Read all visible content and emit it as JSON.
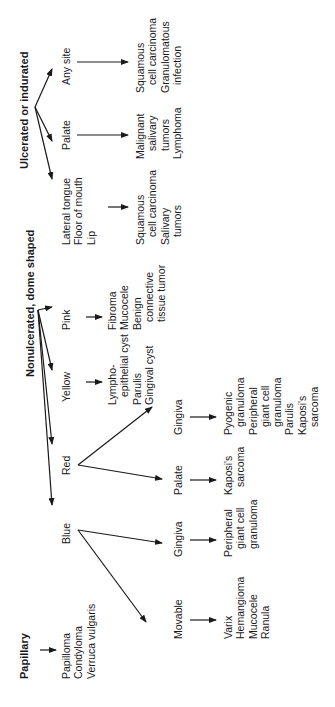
{
  "diagram": {
    "papillary": {
      "title": "Papillary",
      "items": [
        "Papilloma",
        "Condyloma",
        "Verruca vulgaris"
      ]
    },
    "nonulcerated": {
      "title": "Nonulcerated, dome shaped",
      "blue": {
        "label": "Blue",
        "movable": {
          "label": "Movable",
          "items": [
            "Varix",
            "Hemangioma",
            "Mucocele",
            "Ranula"
          ]
        },
        "gingiva": {
          "label": "Gingiva",
          "items": [
            "Peripheral",
            "giant cell",
            "granuloma"
          ]
        }
      },
      "red": {
        "label": "Red",
        "palate": {
          "label": "Palate",
          "items": [
            "Kaposi's",
            "sarcoma"
          ]
        },
        "gingiva": {
          "label": "Gingiva",
          "items": [
            "Pyogenic",
            "granuloma",
            "Peripheral",
            "giant cell",
            "granuloma",
            "Parulis",
            "Kaposi's",
            "sarcoma"
          ]
        }
      },
      "yellow": {
        "label": "Yellow",
        "items": [
          "Lympho-",
          "epithelial cyst",
          "Parulis",
          "Gingival cyst"
        ]
      },
      "pink": {
        "label": "Pink",
        "items": [
          "Fibroma",
          "Mucocele",
          "Benign",
          "connective",
          "tissue tumor"
        ]
      }
    },
    "ulcerated": {
      "title": "Ulcerated or indurated",
      "lateral": {
        "labels": [
          "Lateral tongue",
          "Floor of mouth",
          "Lip"
        ],
        "items": [
          "Squamous",
          "cell carcinoma",
          "Salivary",
          "tumors"
        ]
      },
      "palate": {
        "label": "Palate",
        "items": [
          "Malignant",
          "salivary",
          "tumors",
          "Lymphoma"
        ]
      },
      "anysite": {
        "label": "Any site",
        "items": [
          "Squamous",
          "cell carcinoma",
          "Granulomatous",
          "infection"
        ]
      }
    }
  }
}
